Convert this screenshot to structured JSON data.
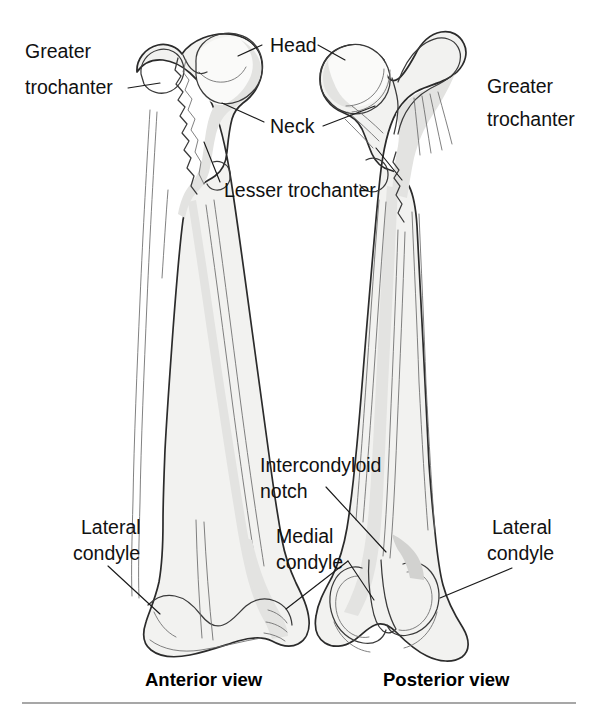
{
  "figure": {
    "title_visible": false,
    "background_color": "#ffffff",
    "ink_color": "#111111",
    "bone_fill_color": "#f2f2f0",
    "bone_shade_color": "#d2d2d0"
  },
  "labels": {
    "greater_trochanter_left": "Greater\ntrochanter",
    "greater_trochanter_left_line1": "Greater",
    "greater_trochanter_left_line2": "trochanter",
    "head": "Head",
    "neck": "Neck",
    "lesser_trochanter": "Lesser trochanter",
    "greater_trochanter_right_line1": "Greater",
    "greater_trochanter_right_line2": "trochanter",
    "intercondyloid_notch_line1": "Intercondyloid",
    "intercondyloid_notch_line2": "notch",
    "medial_condyle_line1": "Medial",
    "medial_condyle_line2": "condyle",
    "lateral_condyle_left_line1": "Lateral",
    "lateral_condyle_left_line2": "condyle",
    "lateral_condyle_right_line1": "Lateral",
    "lateral_condyle_right_line2": "condyle"
  },
  "views": {
    "anterior": "Anterior view",
    "posterior": "Posterior view"
  }
}
